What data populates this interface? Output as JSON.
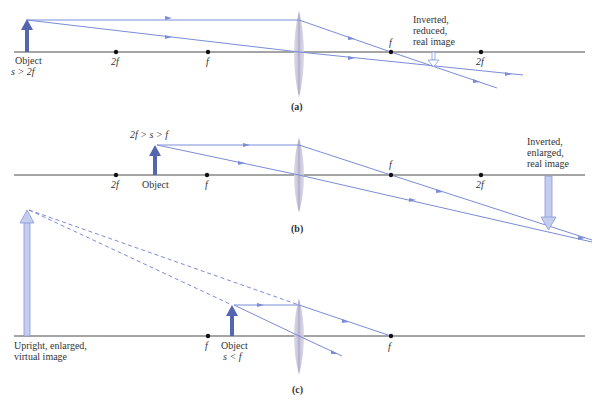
{
  "colors": {
    "axis": "#4a4a4a",
    "ray": "#7a8cd8",
    "lens": "#c9c6dc",
    "object_arrow": "#5566b0",
    "image_arrow": "#c4cdee",
    "point": "#111111",
    "text": "#333333"
  },
  "panels": [
    {
      "id": "a",
      "caption": "(a)",
      "condition": "s > 2f",
      "object_label": "Object",
      "image_label_lines": [
        "Inverted,",
        "reduced,",
        "real image"
      ],
      "points": [
        {
          "label": "2f",
          "x": 116
        },
        {
          "label": "f",
          "x": 208
        },
        {
          "label": "f",
          "x": 391
        },
        {
          "label": "2f",
          "x": 481
        }
      ]
    },
    {
      "id": "b",
      "caption": "(b)",
      "condition": "2f > s > f",
      "object_label": "Object",
      "image_label_lines": [
        "Inverted,",
        "enlarged,",
        "real image"
      ],
      "points": [
        {
          "label": "2f",
          "x": 116
        },
        {
          "label": "f",
          "x": 207
        },
        {
          "label": "f",
          "x": 391
        },
        {
          "label": "2f",
          "x": 481
        }
      ]
    },
    {
      "id": "c",
      "caption": "(c)",
      "condition": "s < f",
      "object_label": "Object",
      "image_label_lines": [
        "Upright, enlarged,",
        "virtual image"
      ],
      "points": [
        {
          "label": "f",
          "x": 208
        },
        {
          "label": "f",
          "x": 391
        }
      ]
    }
  ]
}
